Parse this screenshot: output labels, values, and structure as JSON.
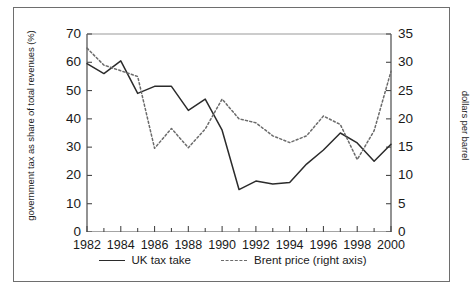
{
  "chart_data": {
    "type": "line",
    "title": "",
    "subtitle": "",
    "xlabel": "",
    "ylabel": "government tax as share of total revenues (%)",
    "ylabel_right": "dollars per barrel",
    "grid": false,
    "legend_position": "bottom-center",
    "x": [
      1982,
      1983,
      1984,
      1985,
      1986,
      1987,
      1988,
      1989,
      1990,
      1991,
      1992,
      1993,
      1994,
      1995,
      1996,
      1997,
      1998,
      1999,
      2000
    ],
    "xlim": [
      1982,
      2000
    ],
    "xticks": [
      1982,
      1984,
      1986,
      1988,
      1990,
      1992,
      1994,
      1996,
      1998,
      2000
    ],
    "xticklabels": [
      "1982",
      "1984",
      "1986",
      "1988",
      "1990",
      "1992",
      "1994",
      "1996",
      "1998",
      "2000"
    ],
    "ylim": [
      0,
      70
    ],
    "yticks": [
      0,
      10,
      20,
      30,
      40,
      50,
      60,
      70
    ],
    "yticklabels": [
      "0",
      "10",
      "20",
      "30",
      "40",
      "50",
      "60",
      "70"
    ],
    "ylim_right": [
      0,
      35
    ],
    "yticks_right": [
      0,
      5,
      10,
      15,
      20,
      25,
      30,
      35
    ],
    "yticklabels_right": [
      "0",
      "5",
      "10",
      "15",
      "20",
      "25",
      "30",
      "35"
    ],
    "series": [
      {
        "name": "UK tax take",
        "axis": "left",
        "style": "solid",
        "color": "#2b2b2b",
        "unit": "%",
        "values": [
          59.5,
          56.0,
          60.5,
          49.0,
          51.5,
          51.5,
          43.0,
          47.0,
          36.0,
          15.0,
          18.0,
          17.0,
          17.5,
          24.0,
          29.0,
          35.0,
          31.5,
          25.0,
          31.0
        ]
      },
      {
        "name": "Brent price (right axis)",
        "axis": "right",
        "style": "dashed",
        "color": "#6b6b6b",
        "unit": "dollars per barrel",
        "values": [
          32.5,
          29.5,
          28.5,
          27.5,
          14.8,
          18.3,
          14.9,
          18.2,
          23.5,
          20.0,
          19.3,
          17.0,
          15.8,
          17.0,
          20.5,
          19.0,
          12.8,
          17.9,
          28.4
        ]
      }
    ],
    "legend": [
      "UK tax take",
      "Brent price (right axis)"
    ]
  },
  "figure": {
    "border_color": "#6e6e6e",
    "axis_color": "#4a4a4a",
    "background": "#ffffff"
  },
  "legend_items": [
    {
      "label": "UK tax take",
      "style": "solid"
    },
    {
      "label": "Brent price (right axis)",
      "style": "dashed"
    }
  ]
}
